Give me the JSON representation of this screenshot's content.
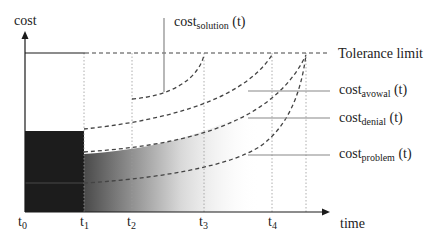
{
  "axes": {
    "y_label": "cost",
    "x_label": "time"
  },
  "ticks": [
    {
      "base": "t",
      "sub": "0"
    },
    {
      "base": "t",
      "sub": "1"
    },
    {
      "base": "t",
      "sub": "2"
    },
    {
      "base": "t",
      "sub": "3"
    },
    {
      "base": "t",
      "sub": "4"
    }
  ],
  "legend": {
    "tolerance": "Tolerance limit",
    "solution": {
      "base": "cost",
      "sub": "solution",
      "suffix": " (t)"
    },
    "avowal": {
      "base": "cost",
      "sub": "avowal",
      "suffix": " (t)"
    },
    "denial": {
      "base": "cost",
      "sub": "denial",
      "suffix": " (t)"
    },
    "problem": {
      "base": "cost",
      "sub": "problem",
      "suffix": " (t)"
    }
  },
  "colors": {
    "axis": "#1a1a1a",
    "dark_region": "#1c1c1c",
    "gradient_start": "#4a4a4a",
    "gradient_end": "#ffffff",
    "dashed": "#444444",
    "leader": "#888888",
    "grid": "#999999"
  }
}
